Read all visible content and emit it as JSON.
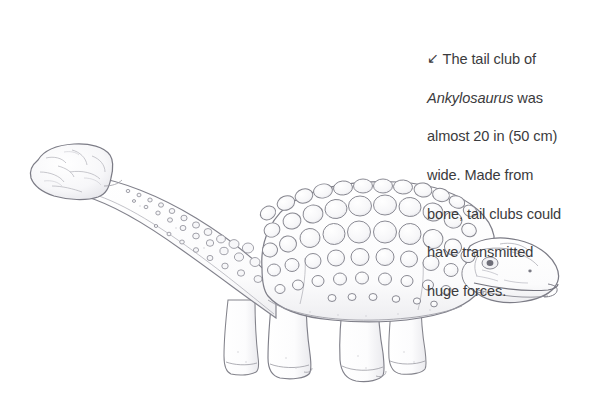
{
  "page": {
    "background_color": "#ffffff",
    "width": 610,
    "height": 406
  },
  "caption": {
    "arrow_icon": "arrow-down-left-icon",
    "arrow_glyph": "↙",
    "text_color": "#3b3b3d",
    "full_text": "The tail club of Ankylosaurus was almost 20 in (50 cm) wide. Made from bone, tail clubs could have transmitted huge forces.",
    "lines": [
      "The tail club of",
      "Ankylosaurus was",
      "almost 20 in (50 cm)",
      "wide. Made from",
      "bone, tail clubs could",
      "have transmitted",
      "huge forces."
    ],
    "italic_term": "Ankylosaurus",
    "segments": {
      "line1": "The tail club of",
      "line2_italic": "Ankylosaurus",
      "line2_rest": " was",
      "line3": "almost 20 in (50 cm)",
      "line4": "wide. Made from",
      "line5": "bone, tail clubs could",
      "line6": "have transmitted",
      "line7": "huge forces."
    },
    "measurements": {
      "width_imperial": "20 in",
      "width_metric": "50 cm"
    }
  },
  "illustration": {
    "subject": "Ankylosaurus",
    "style": "pencil line drawing",
    "line_color": "#7c7c84",
    "fill_color": "#fcfcfc",
    "shading_color": "#ededf0",
    "parts": [
      "tail-club",
      "tail",
      "body",
      "armor-osteoderms",
      "head",
      "eye",
      "beak",
      "front-legs",
      "hind-legs"
    ],
    "orientation": "facing right, tail club at upper left"
  }
}
